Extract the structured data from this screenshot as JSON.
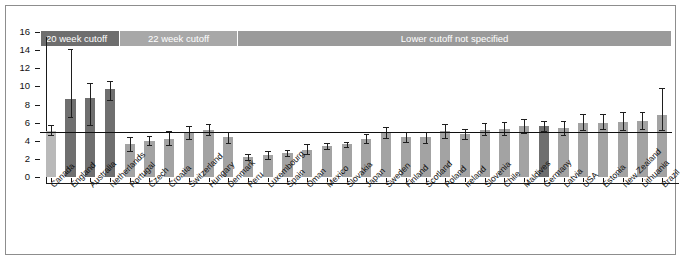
{
  "chart_data": {
    "type": "bar",
    "title": "",
    "xlabel": "",
    "ylabel": "",
    "ylim": [
      0,
      16
    ],
    "ytick_labels": [
      "0",
      "2",
      "4",
      "6",
      "8",
      "10",
      "12",
      "14",
      "16"
    ],
    "yticks": [
      0,
      2,
      4,
      6,
      8,
      10,
      12,
      14,
      16
    ],
    "grid": false,
    "legend_position": "none",
    "reference_line": 5.0,
    "categories": [
      "Canada",
      "England",
      "Australia",
      "Netherlands",
      "Portugal",
      "Czech",
      "Croatia",
      "Switzerland",
      "Hungary",
      "Denmark",
      "Peru",
      "Luxembourg",
      "Spain",
      "Oman",
      "Mexico",
      "Slovakia",
      "Japan",
      "Sweden",
      "Finland",
      "Scotland",
      "Poland",
      "Ireland",
      "Slovenia",
      "Chile",
      "Maldives",
      "Germany",
      "Latvia",
      "USA",
      "Estonia",
      "New Zealand",
      "Lithuania",
      "Brazil"
    ],
    "values": [
      5.1,
      8.6,
      8.7,
      9.7,
      3.6,
      4.0,
      4.2,
      4.9,
      5.2,
      4.4,
      2.2,
      2.4,
      2.6,
      3.0,
      3.4,
      3.6,
      4.2,
      4.9,
      4.4,
      4.4,
      5.1,
      4.7,
      5.2,
      5.3,
      5.6,
      5.6,
      5.4,
      6.0,
      6.0,
      6.1,
      6.2,
      6.8
    ],
    "err_low": [
      4.6,
      6.6,
      5.7,
      8.5,
      2.9,
      3.5,
      3.5,
      4.2,
      4.6,
      3.8,
      1.9,
      2.0,
      2.3,
      2.5,
      3.1,
      3.3,
      3.7,
      4.3,
      3.9,
      3.8,
      4.3,
      4.2,
      4.6,
      4.6,
      4.9,
      5.1,
      4.6,
      5.2,
      5.3,
      5.2,
      5.3,
      5.2
    ],
    "err_high": [
      5.7,
      14.1,
      10.4,
      10.6,
      4.4,
      4.5,
      5.1,
      5.6,
      5.9,
      5.0,
      2.5,
      2.9,
      3.0,
      3.6,
      3.7,
      3.9,
      4.7,
      5.5,
      5.0,
      5.0,
      5.8,
      5.3,
      6.0,
      6.1,
      6.4,
      6.2,
      6.2,
      7.0,
      6.9,
      7.2,
      7.2,
      9.8
    ],
    "bar_shades": [
      "light",
      "dark",
      "dark",
      "dark",
      "mid",
      "mid",
      "mid",
      "mid",
      "mid",
      "mid",
      "mid",
      "mid",
      "mid",
      "mid",
      "mid",
      "mid",
      "mid",
      "mid",
      "mid",
      "mid",
      "mid",
      "mid",
      "mid",
      "mid",
      "mid",
      "dark",
      "mid",
      "mid",
      "mid",
      "mid",
      "mid",
      "mid"
    ],
    "annotation_bands": [
      {
        "label": "20 week cutoff",
        "start_index": 0,
        "end_index": 3,
        "color": "#6e6e6e"
      },
      {
        "label": "22 week cutoff",
        "start_index": 4,
        "end_index": 9,
        "color": "#a8a8a8"
      },
      {
        "label": "Lower cutoff not specified",
        "start_index": 10,
        "end_index": 31,
        "color": "#9a9a9a"
      }
    ]
  },
  "colors": {
    "axis": "#1a1a1a",
    "reference_line": "#101010",
    "bar_light": "#b9b9b9",
    "bar_mid": "#a3a3a3",
    "bar_dark": "#6f6f6f",
    "frame": "#8d8d8d",
    "background": "#ffffff"
  }
}
